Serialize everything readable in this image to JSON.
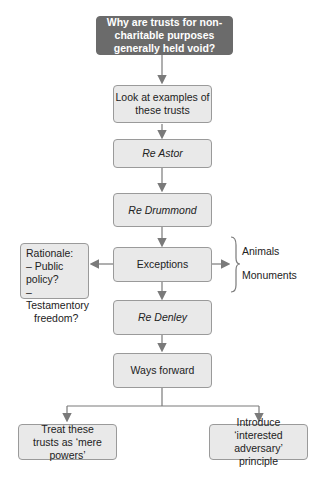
{
  "diagram": {
    "title": "Why are trusts for non-charitable purposes generally held void?",
    "nodes": {
      "examples": "Look at examples of these trusts",
      "astor": "Re Astor",
      "drummond": "Re Drummond",
      "exceptions": "Exceptions",
      "denley": "Re Denley",
      "ways_forward": "Ways forward",
      "mere_powers": "Treat these trusts as ‘mere powers’",
      "interested_adversary": "Introduce ‘interested adversary’ principle"
    },
    "rationale": {
      "heading": "Rationale:",
      "line1": "– Public policy?",
      "line2": "– Testamentory",
      "line3": "freedom?"
    },
    "exception_types": [
      "Animals",
      "Monuments"
    ],
    "colors": {
      "title_bg": "#6b6b6b",
      "box_bg": "#e9e9e9",
      "line": "#7a7a7a"
    }
  }
}
